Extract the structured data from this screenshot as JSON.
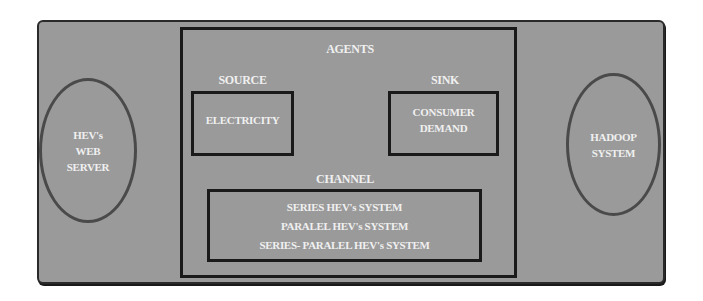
{
  "diagram": {
    "left_node": {
      "lines": [
        "HEV's",
        "WEB",
        "SERVER"
      ]
    },
    "right_node": {
      "lines": [
        "HADOOP",
        "SYSTEM"
      ]
    },
    "agents": {
      "title": "AGENTS",
      "source": {
        "title": "SOURCE",
        "content": "ELECTRICITY"
      },
      "sink": {
        "title": "SINK",
        "content_lines": [
          "CONSUMER",
          "DEMAND"
        ]
      },
      "channel": {
        "title": "CHANNEL",
        "items": [
          "SERIES HEV's SYSTEM",
          "PARALEL HEV's SYSTEM",
          "SERIES- PARALEL HEV's SYSTEM"
        ]
      }
    },
    "colors": {
      "panel_fill": "#9a9a9a",
      "border": "#1a1a1a",
      "ellipse_border": "#4a4a4a",
      "text": "#f0f0f0"
    }
  }
}
